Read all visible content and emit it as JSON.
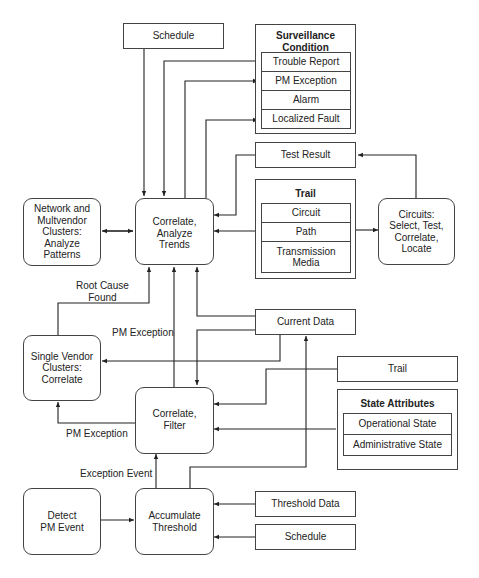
{
  "nodes": {
    "schedule_top": "Schedule",
    "surveillance": {
      "title_line1": "Surveillance",
      "title_line2": "Condition",
      "items": [
        "Trouble Report",
        "PM Exception",
        "Alarm",
        "Localized Fault"
      ]
    },
    "test_result": "Test Result",
    "trail_group": {
      "title": "Trail",
      "items": [
        "Circuit",
        "Path",
        "Transmission Media"
      ]
    },
    "network_clusters": [
      "Network and",
      "Multvendor",
      "Clusters:",
      "Analyze",
      "Patterns"
    ],
    "correlate_analyze": [
      "Correlate,",
      "Analyze",
      "Trends"
    ],
    "circuits": [
      "Circuits:",
      "Select, Test,",
      "Correlate,",
      "Locate"
    ],
    "current_data": "Current Data",
    "single_vendor": [
      "Single Vendor",
      "Clusters:",
      "Correlate"
    ],
    "trail_box": "Trail",
    "state_attributes": {
      "title": "State Attributes",
      "items": [
        "Operational State",
        "Administrative State"
      ]
    },
    "correlate_filter": [
      "Correlate,",
      "Filter"
    ],
    "detect_pm": [
      "Detect",
      "PM Event"
    ],
    "accumulate": [
      "Accumulate",
      "Threshold"
    ],
    "threshold_data": "Threshold Data",
    "schedule_bottom": "Schedule"
  },
  "labels": {
    "root_cause": [
      "Root Cause",
      "Found"
    ],
    "pm_exception_mid": "PM Exception",
    "pm_exception_low": "PM Exception",
    "exception_event": "Exception Event"
  },
  "colors": {
    "line": "#222222",
    "border": "#444444",
    "background": "#ffffff"
  }
}
